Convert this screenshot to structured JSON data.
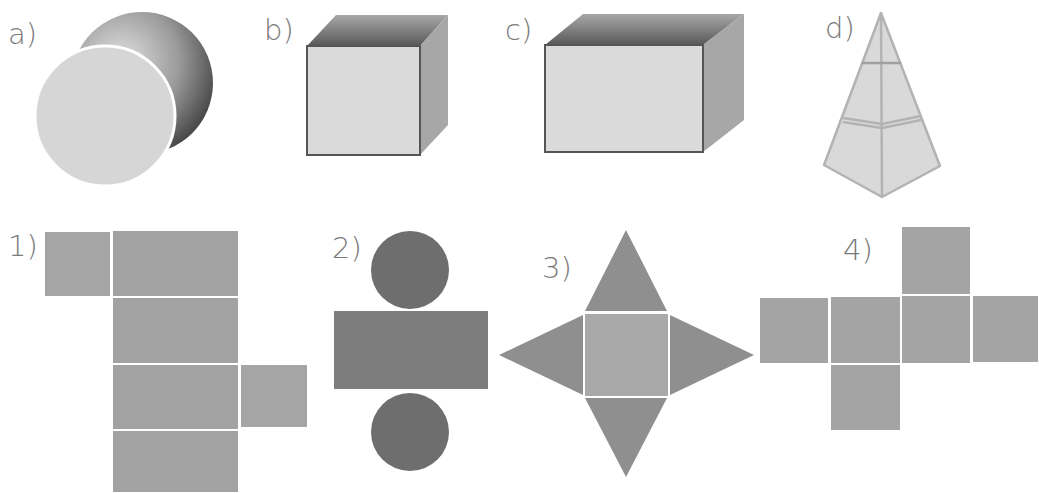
{
  "solids": {
    "a": {
      "label": "a)",
      "shape": "cylinder"
    },
    "b": {
      "label": "b)",
      "shape": "cube"
    },
    "c": {
      "label": "c)",
      "shape": "rectangular prism"
    },
    "d": {
      "label": "d)",
      "shape": "square pyramid"
    }
  },
  "nets": {
    "n1": {
      "label": "1)",
      "shape": "rectangular prism net"
    },
    "n2": {
      "label": "2)",
      "shape": "cylinder net"
    },
    "n3": {
      "label": "3)",
      "shape": "square pyramid net"
    },
    "n4": {
      "label": "4)",
      "shape": "cube net"
    }
  },
  "colors": {
    "face_light": "#dcdcdc",
    "face_mid": "#a9a9a9",
    "face_dark": "#6f6f6f",
    "net_fill": "#a3a3a3",
    "circle_fill": "#6d6d6d",
    "outline": "#555555",
    "pyramid_edge": "#b5b5b5",
    "label": "#7a7a7a"
  }
}
